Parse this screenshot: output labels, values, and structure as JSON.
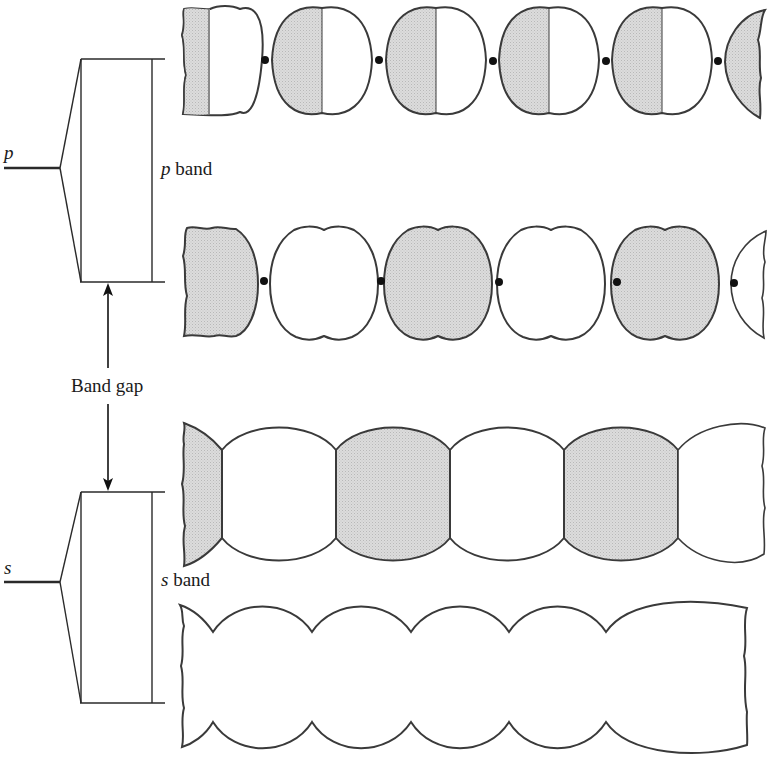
{
  "labels": {
    "p_level": "p",
    "s_level": "s",
    "p_band_symbol": "p",
    "p_band_word": "band",
    "s_band_symbol": "s",
    "s_band_word": "band",
    "band_gap": "Band gap"
  },
  "colors": {
    "line": "#3a3a3a",
    "shade": "#d9d9d9",
    "dot": "#111111",
    "background": "#ffffff"
  },
  "rows": [
    {
      "name": "p-band-bonding-row",
      "description": "p orbitals, adjacent lobes of opposite sign facing each other, nodes (dots) between atoms",
      "lobes_per_orbital": 2
    },
    {
      "name": "p-band-antibonding-row",
      "description": "p orbitals alternately shaded, nodes (dots) between atoms",
      "pattern": [
        "shaded",
        "white",
        "shaded",
        "white",
        "shaded",
        "white"
      ]
    },
    {
      "name": "s-band-antibonding-row",
      "description": "s orbitals alternating shading, joined by vertical node lines",
      "pattern": [
        "shaded",
        "white",
        "shaded",
        "white",
        "shaded",
        "white"
      ]
    },
    {
      "name": "s-band-bonding-row",
      "description": "s orbitals all in phase, merged into continuous scalloped band",
      "pattern": [
        "white"
      ]
    }
  ]
}
